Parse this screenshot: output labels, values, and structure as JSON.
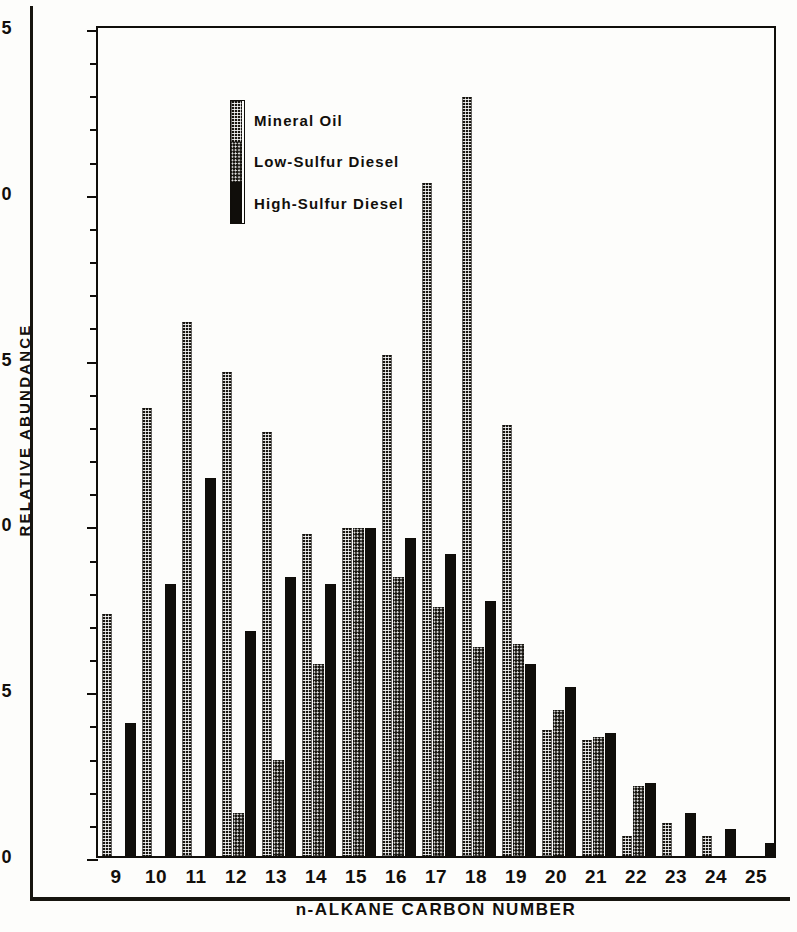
{
  "chart_data": {
    "type": "bar",
    "title": "",
    "xlabel": "n-ALKANE CARBON NUMBER",
    "ylabel": "RELATIVE ABUNDANCE",
    "ylim": [
      0,
      2.5
    ],
    "xlim_categories": [
      "9",
      "10",
      "11",
      "12",
      "13",
      "14",
      "15",
      "16",
      "17",
      "18",
      "19",
      "20",
      "21",
      "22",
      "23",
      "24",
      "25"
    ],
    "y_major_ticks": [
      "0",
      "0.5",
      "1.0",
      "1.5",
      "2.0",
      "2.5"
    ],
    "y_major_tick_values": [
      0,
      0.5,
      1.0,
      1.5,
      2.0,
      2.5
    ],
    "y_minor_tick_step": 0.1,
    "grid": false,
    "legend_position": "upper-left-inside",
    "categories": [
      "9",
      "10",
      "11",
      "12",
      "13",
      "14",
      "15",
      "16",
      "17",
      "18",
      "19",
      "20",
      "21",
      "22",
      "23",
      "24",
      "25"
    ],
    "series": [
      {
        "name": "Mineral Oil",
        "pattern": "checkered",
        "values": [
          0.73,
          1.35,
          1.61,
          1.46,
          1.28,
          0.97,
          0.99,
          1.51,
          2.03,
          2.29,
          1.3,
          0.38,
          0.35,
          0.06,
          0.1,
          0.06,
          0.0
        ]
      },
      {
        "name": "Low-Sulfur Diesel",
        "pattern": "dotted",
        "values": [
          0.0,
          0.0,
          0.0,
          0.13,
          0.29,
          0.58,
          0.99,
          0.84,
          0.75,
          0.63,
          0.64,
          0.44,
          0.36,
          0.21,
          0.0,
          0.0,
          0.0
        ]
      },
      {
        "name": "High-Sulfur Diesel",
        "pattern": "solid",
        "values": [
          0.4,
          0.82,
          1.14,
          0.68,
          0.84,
          0.82,
          0.99,
          0.96,
          0.91,
          0.77,
          0.58,
          0.51,
          0.37,
          0.22,
          0.13,
          0.08,
          0.04
        ]
      }
    ]
  },
  "legend": {
    "items": [
      {
        "label": "Mineral Oil"
      },
      {
        "label": "Low-Sulfur Diesel"
      },
      {
        "label": "High-Sulfur Diesel"
      }
    ]
  },
  "colors": {
    "ink": "#100e0a",
    "paper": "#fdfdfb"
  }
}
